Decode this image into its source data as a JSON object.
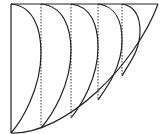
{
  "diagram": {
    "type": "geometric-construction",
    "colors": {
      "line": "#222222",
      "background": "#ffffff"
    },
    "frame": {
      "top_left": [
        11,
        4
      ],
      "top_right": [
        158,
        4
      ],
      "bottom_left": [
        11,
        133
      ]
    },
    "outer_curve": {
      "from": [
        11,
        133
      ],
      "to": [
        158,
        4
      ]
    },
    "dotted_guides": [
      {
        "x": 41,
        "y_top": 4,
        "y_bottom": 128
      },
      {
        "x": 71,
        "y_top": 4,
        "y_bottom": 118
      },
      {
        "x": 98,
        "y_top": 4,
        "y_bottom": 100
      },
      {
        "x": 122,
        "y_top": 4,
        "y_bottom": 76
      }
    ],
    "inner_arcs": [
      {
        "start": [
          11,
          4
        ],
        "bulge_x": 41,
        "end": [
          11,
          133
        ]
      },
      {
        "start": [
          41,
          4
        ],
        "bulge_x": 71,
        "end": [
          41,
          128
        ]
      },
      {
        "start": [
          71,
          4
        ],
        "bulge_x": 98,
        "end": [
          71,
          118
        ]
      },
      {
        "start": [
          98,
          4
        ],
        "bulge_x": 122,
        "end": [
          98,
          100
        ]
      },
      {
        "start": [
          122,
          4
        ],
        "bulge_x": 140,
        "end": [
          122,
          76
        ]
      }
    ]
  }
}
